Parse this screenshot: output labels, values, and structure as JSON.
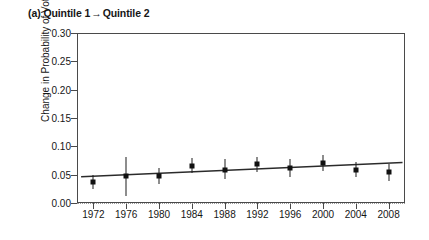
{
  "panel": {
    "label": "(a)",
    "from": "Quintile 1",
    "arrow": "→",
    "to": "Quintile 2",
    "title": "(a) Quintile 1 → Quintile 2"
  },
  "colors": {
    "marker": "#111111",
    "errorbar": "#1c1c1c",
    "trendline": "#2b2b2b",
    "axis": "#4a4a4a",
    "zero_line": "#9a9a9a",
    "text": "#161616",
    "background": "#ffffff"
  },
  "chart_data": {
    "type": "scatter",
    "xlabel": "",
    "ylabel": "Change in Probability of Voting",
    "xlim": [
      1970,
      2010
    ],
    "ylim": [
      0.0,
      0.3
    ],
    "yticks": [
      0.0,
      0.05,
      0.1,
      0.15,
      0.2,
      0.25,
      0.3
    ],
    "ytick_labels": [
      "0.00",
      "0.05",
      "0.10",
      "0.15",
      "0.20",
      "0.25",
      "0.30"
    ],
    "xticks": [
      1972,
      1976,
      1980,
      1984,
      1988,
      1992,
      1996,
      2000,
      2004,
      2008
    ],
    "xtick_labels": [
      "1972",
      "1976",
      "1980",
      "1984",
      "1988",
      "1992",
      "1996",
      "2000",
      "2004",
      "2008"
    ],
    "grid": false,
    "legend": "none",
    "zero_reference_line": 0.0,
    "x": [
      1972,
      1976,
      1980,
      1984,
      1988,
      1992,
      1996,
      2000,
      2004,
      2008
    ],
    "values": [
      0.037,
      0.047,
      0.048,
      0.066,
      0.059,
      0.068,
      0.061,
      0.07,
      0.059,
      0.054
    ],
    "error_low": [
      0.024,
      0.013,
      0.034,
      0.053,
      0.043,
      0.055,
      0.046,
      0.057,
      0.046,
      0.039
    ],
    "error_high": [
      0.05,
      0.081,
      0.062,
      0.08,
      0.077,
      0.081,
      0.077,
      0.084,
      0.073,
      0.069
    ],
    "trendline": {
      "type": "line",
      "x": [
        1970.5,
        2009.7
      ],
      "y": [
        0.0464,
        0.0714
      ]
    }
  }
}
